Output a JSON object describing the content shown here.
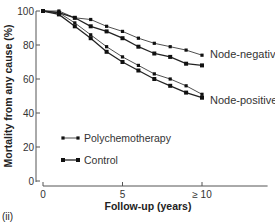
{
  "chart_data": {
    "type": "line",
    "title": "",
    "panel_label": "(ii)",
    "xlabel": "Follow-up (years)",
    "ylabel": "Mortality from any cause (%)",
    "x": [
      0,
      1,
      2,
      3,
      4,
      5,
      6,
      7,
      8,
      9,
      10
    ],
    "x_ticks": [
      0,
      5,
      10
    ],
    "x_tick_labels": [
      "0",
      "5",
      "≥ 10"
    ],
    "y_ticks": [
      0,
      20,
      40,
      60,
      80,
      100
    ],
    "y_tick_labels": [
      "0",
      "20",
      "40",
      "60",
      "80",
      "100"
    ],
    "xlim": [
      0,
      14
    ],
    "ylim": [
      0,
      100
    ],
    "grid": false,
    "series": [
      {
        "name": "Node-negative Polychemotherapy",
        "group": "Node-negative",
        "arm": "Polychemotherapy",
        "values": [
          100,
          100,
          96,
          95,
          91,
          88,
          84,
          81,
          79,
          77,
          74
        ]
      },
      {
        "name": "Node-negative Control",
        "group": "Node-negative",
        "arm": "Control",
        "values": [
          100,
          99,
          96,
          91,
          88,
          84,
          79,
          75,
          73,
          69,
          68
        ]
      },
      {
        "name": "Node-positive Polychemotherapy",
        "group": "Node-positive",
        "arm": "Polychemotherapy",
        "values": [
          100,
          99,
          93,
          86,
          79,
          73,
          68,
          63,
          60,
          56,
          51
        ]
      },
      {
        "name": "Node-positive Control",
        "group": "Node-positive",
        "arm": "Control",
        "values": [
          100,
          98,
          91,
          84,
          76,
          70,
          65,
          60,
          56,
          52,
          49
        ]
      }
    ],
    "annotations": [
      {
        "text": "Node-negative",
        "near_series": "Node-negative"
      },
      {
        "text": "Node-positive",
        "near_series": "Node-positive"
      }
    ],
    "legend": {
      "position": "lower-left inside",
      "entries": [
        {
          "label": "Polychemotherapy",
          "marker": "small-square",
          "line": "thin"
        },
        {
          "label": "Control",
          "marker": "large-square",
          "line": "thick"
        }
      ]
    }
  }
}
